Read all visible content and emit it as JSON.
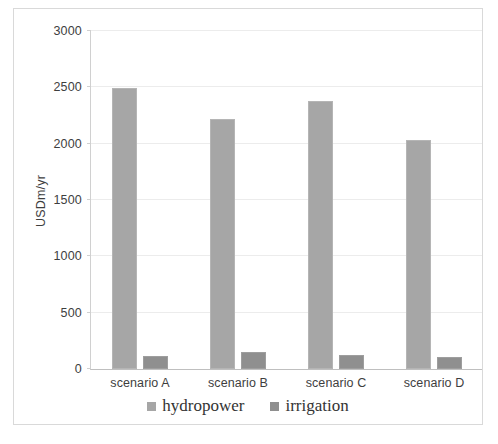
{
  "chart_data": {
    "type": "bar",
    "title": "",
    "xlabel": "",
    "ylabel": "USDm/yr",
    "ylim": [
      0,
      3000
    ],
    "ytick_step": 500,
    "grid": true,
    "legend_position": "bottom",
    "categories": [
      "scenario A",
      "scenario B",
      "scenario C",
      "scenario D"
    ],
    "series": [
      {
        "name": "hydropower",
        "color": "#a6a6a6",
        "values": [
          2490,
          2210,
          2375,
          2030
        ]
      },
      {
        "name": "irrigation",
        "color": "#8f8f8f",
        "values": [
          115,
          150,
          120,
          110
        ]
      }
    ],
    "ytick_labels": [
      "0",
      "500",
      "1000",
      "1500",
      "2000",
      "2500",
      "3000"
    ],
    "ytick_values": [
      0,
      500,
      1000,
      1500,
      2000,
      2500,
      3000
    ]
  },
  "axis": {
    "y_title": "USDm/yr"
  },
  "legend": {
    "items": [
      {
        "label": "hydropower",
        "color": "#a6a6a6"
      },
      {
        "label": "irrigation",
        "color": "#8f8f8f"
      }
    ]
  }
}
